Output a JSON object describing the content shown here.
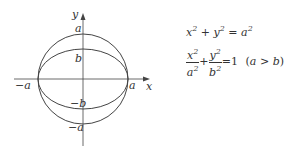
{
  "diagram": {
    "axes": {
      "x_label": "x",
      "y_label": "y"
    },
    "labels": {
      "a_top": "a",
      "b_top": "b",
      "neg_a_left": "−a",
      "a_right": "a",
      "neg_b": "−b",
      "neg_a_bottom": "−a"
    },
    "shapes": [
      {
        "type": "circle",
        "center": [
          0,
          0
        ],
        "radius": "a"
      },
      {
        "type": "ellipse",
        "center": [
          0,
          0
        ],
        "semi_major": "a",
        "semi_minor": "b"
      }
    ]
  },
  "equations": {
    "circle": {
      "lhs_x": "x",
      "plus": "+",
      "lhs_y": "y",
      "eq": "=",
      "rhs": "a",
      "exp": "2"
    },
    "ellipse": {
      "num1": "x",
      "den1": "a",
      "num2": "y",
      "den2": "b",
      "exp": "2",
      "plus": "+",
      "eq": "=1",
      "cond_open": "(",
      "cond_a": "a",
      "cond_gt": ">",
      "cond_b": "b",
      "cond_close": ")"
    }
  }
}
